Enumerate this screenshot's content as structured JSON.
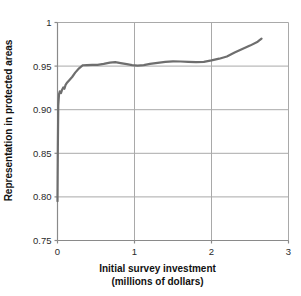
{
  "chart_data": {
    "type": "line",
    "title": "",
    "xlabel": "Initial survey investment (millions of dollars)",
    "xlabel_line1": "Initial survey investment",
    "xlabel_line2": "(millions of dollars)",
    "ylabel": "Representation in protected areas",
    "xlim": [
      0,
      3
    ],
    "ylim": [
      0.75,
      1
    ],
    "xticks": [
      0,
      1,
      2,
      3
    ],
    "xtick_labels": [
      "0",
      "1",
      "2",
      "3"
    ],
    "yticks": [
      0.75,
      0.8,
      0.85,
      0.9,
      0.95,
      1
    ],
    "ytick_labels": [
      "0.75",
      "0.80",
      "0.85",
      "0.90",
      "0.95",
      "1"
    ],
    "grid": true,
    "legend": "none",
    "line_color": "#6e6e6e",
    "line_width": 2.2,
    "axis_color": "#8a8a8a",
    "grid_color": "#a9a9a9",
    "background": "#ffffff",
    "series": [
      {
        "name": "Representation in protected areas",
        "x": [
          0.0,
          0.005,
          0.01,
          0.02,
          0.03,
          0.045,
          0.06,
          0.075,
          0.09,
          0.105,
          0.12,
          0.15,
          0.19,
          0.23,
          0.28,
          0.33,
          0.38,
          0.45,
          0.52,
          0.6,
          0.68,
          0.75,
          0.82,
          0.9,
          0.97,
          1.04,
          1.12,
          1.2,
          1.3,
          1.4,
          1.5,
          1.6,
          1.7,
          1.8,
          1.9,
          2.0,
          2.1,
          2.2,
          2.3,
          2.4,
          2.5,
          2.6,
          2.65
        ],
        "y": [
          0.795,
          0.86,
          0.905,
          0.918,
          0.921,
          0.919,
          0.923,
          0.9255,
          0.924,
          0.9285,
          0.9305,
          0.9335,
          0.9375,
          0.9425,
          0.9475,
          0.951,
          0.9512,
          0.9513,
          0.9515,
          0.9525,
          0.954,
          0.9545,
          0.9535,
          0.9522,
          0.9512,
          0.9505,
          0.9512,
          0.9525,
          0.9538,
          0.9548,
          0.9555,
          0.9553,
          0.9548,
          0.9545,
          0.9548,
          0.9565,
          0.9585,
          0.961,
          0.9655,
          0.9695,
          0.9735,
          0.978,
          0.9815
        ]
      }
    ]
  }
}
